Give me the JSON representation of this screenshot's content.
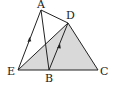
{
  "diagram": {
    "type": "geometry",
    "points": {
      "A": {
        "label": "A",
        "x": 41,
        "y": 10
      },
      "D": {
        "label": "D",
        "x": 68,
        "y": 23
      },
      "E": {
        "label": "E",
        "x": 18,
        "y": 70
      },
      "B": {
        "label": "B",
        "x": 49,
        "y": 70
      },
      "C": {
        "label": "C",
        "x": 98,
        "y": 70
      }
    },
    "segments": [
      "AE",
      "AB",
      "AD",
      "DC",
      "EC",
      "ED",
      "DB"
    ],
    "shaded_region": [
      "E",
      "D",
      "C"
    ],
    "parallel_marks": [
      "AE",
      "BD"
    ],
    "colors": {
      "stroke": "#222222",
      "fill": "#d9d9d9"
    }
  }
}
